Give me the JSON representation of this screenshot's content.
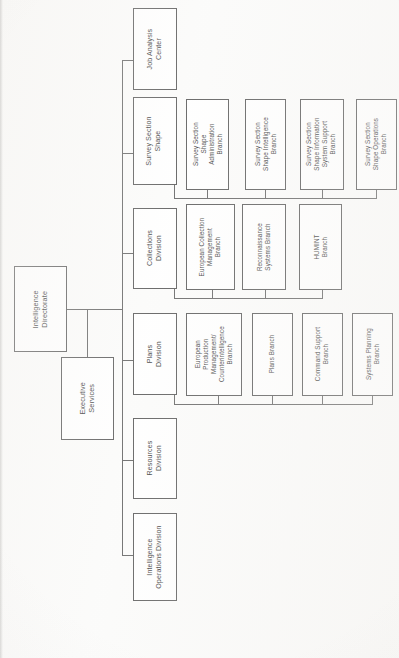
{
  "document": {
    "type": "organizational-chart",
    "orientation": "rotated-90-ccw",
    "page_background": "#fbfbfa",
    "box_border_color": "#4a4a4a",
    "connector_color": "#555555",
    "text_color": "#1c1c1c"
  },
  "chart_data": {
    "type": "diagram",
    "root": "Intelligence Directorate",
    "nodes": [
      {
        "id": "intelligence-directorate",
        "label": "Intelligence\nDirectorate",
        "level": 0
      },
      {
        "id": "executive-services",
        "label": "Executive\nServices",
        "level": 1
      },
      {
        "id": "job-analysis-center",
        "label": "Job Analysis\nCenter",
        "level": 1
      },
      {
        "id": "survey-section-shape",
        "label": "Survey Section\nShape",
        "level": 1
      },
      {
        "id": "collections-division",
        "label": "Collections\nDivision",
        "level": 1
      },
      {
        "id": "plans-division",
        "label": "Plans\nDivision",
        "level": 1
      },
      {
        "id": "resources-division",
        "label": "Resources\nDivision",
        "level": 1
      },
      {
        "id": "intelligence-operations-division",
        "label": "Intelligence\nOperations Division",
        "level": 1
      },
      {
        "id": "survey-shape-administration-branch",
        "label": "Survey Section\nShape\nAdministration\nBranch",
        "level": 2,
        "parent": "survey-section-shape"
      },
      {
        "id": "survey-shape-intelligence-branch",
        "label": "Survey Section\nShape Intelligence\nBranch",
        "level": 2,
        "parent": "survey-section-shape"
      },
      {
        "id": "survey-shape-information-system-support-branch",
        "label": "Survey Section\nShape Information\nSystem Support\nBranch",
        "level": 2,
        "parent": "survey-section-shape"
      },
      {
        "id": "survey-shape-operations-branch",
        "label": "Survey Section\nShape Operations\nBranch",
        "level": 2,
        "parent": "survey-section-shape"
      },
      {
        "id": "european-collection-management-branch",
        "label": "European Collection\nManagement\nBranch",
        "level": 2,
        "parent": "collections-division"
      },
      {
        "id": "reconnaissance-systems-branch",
        "label": "Reconnaissance\nSystems Branch",
        "level": 2,
        "parent": "collections-division"
      },
      {
        "id": "humint-branch",
        "label": "HUMINT\nBranch",
        "level": 2,
        "parent": "collections-division"
      },
      {
        "id": "european-production-management-counterintelligence-branch",
        "label": "European\nProduction\nManagement/\nCounterintelligence\nBranch",
        "level": 2,
        "parent": "plans-division"
      },
      {
        "id": "plans-branch",
        "label": "Plans Branch",
        "level": 2,
        "parent": "plans-division"
      },
      {
        "id": "command-support-branch",
        "label": "Command Support\nBranch",
        "level": 2,
        "parent": "plans-division"
      },
      {
        "id": "systems-planning-branch",
        "label": "Systems Planning\nBranch",
        "level": 2,
        "parent": "plans-division"
      }
    ],
    "edges": [
      {
        "from": "intelligence-directorate",
        "to": "executive-services"
      },
      {
        "from": "intelligence-directorate",
        "to": "job-analysis-center"
      },
      {
        "from": "intelligence-directorate",
        "to": "survey-section-shape"
      },
      {
        "from": "intelligence-directorate",
        "to": "collections-division"
      },
      {
        "from": "intelligence-directorate",
        "to": "plans-division"
      },
      {
        "from": "intelligence-directorate",
        "to": "resources-division"
      },
      {
        "from": "intelligence-directorate",
        "to": "intelligence-operations-division"
      },
      {
        "from": "survey-section-shape",
        "to": "survey-shape-administration-branch"
      },
      {
        "from": "survey-section-shape",
        "to": "survey-shape-intelligence-branch"
      },
      {
        "from": "survey-section-shape",
        "to": "survey-shape-information-system-support-branch"
      },
      {
        "from": "survey-section-shape",
        "to": "survey-shape-operations-branch"
      },
      {
        "from": "collections-division",
        "to": "european-collection-management-branch"
      },
      {
        "from": "collections-division",
        "to": "reconnaissance-systems-branch"
      },
      {
        "from": "collections-division",
        "to": "humint-branch"
      },
      {
        "from": "plans-division",
        "to": "european-production-management-counterintelligence-branch"
      },
      {
        "from": "plans-division",
        "to": "plans-branch"
      },
      {
        "from": "plans-division",
        "to": "command-support-branch"
      },
      {
        "from": "plans-division",
        "to": "systems-planning-branch"
      }
    ]
  },
  "boxes": {
    "intelligence_directorate": "Intelligence\nDirectorate",
    "executive_services": "Executive\nServices",
    "job_analysis_center": "Job Analysis\nCenter",
    "survey_section_shape": "Survey Section\nShape",
    "collections_division": "Collections\nDivision",
    "plans_division": "Plans\nDivision",
    "resources_division": "Resources\nDivision",
    "intelligence_operations_division": "Intelligence\nOperations Division",
    "survey_shape_administration_branch": "Survey Section\nShape\nAdministration\nBranch",
    "survey_shape_intelligence_branch": "Survey Section\nShape Intelligence\nBranch",
    "survey_shape_information_system_support_branch": "Survey Section\nShape Information\nSystem Support\nBranch",
    "survey_shape_operations_branch": "Survey Section\nShape Operations\nBranch",
    "european_collection_management_branch": "European Collection\nManagement\nBranch",
    "reconnaissance_systems_branch": "Reconnaissance\nSystems Branch",
    "humint_branch": "HUMINT\nBranch",
    "european_production_management_counterintelligence_branch": "European\nProduction\nManagement/\nCounterintelligence\nBranch",
    "plans_branch": "Plans Branch",
    "command_support_branch": "Command Support\nBranch",
    "systems_planning_branch": "Systems Planning\nBranch"
  }
}
